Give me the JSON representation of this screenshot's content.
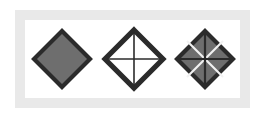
{
  "figure": {
    "page_background": "#ffffff",
    "frame": {
      "band_color": "#e9e9e9",
      "inner_panel_color": "#ffffff",
      "band_label": "outer-frame-band",
      "panel_label": "inner-white-panel"
    },
    "palette": {
      "fill_gray": "#6e6e6e",
      "stroke_dark": "#2b2b2b",
      "stroke_light": "#f2f2f2",
      "fill_white": "#ffffff"
    },
    "shapes": [
      {
        "index": 1,
        "name": "solid-gray-diamond",
        "label": "Solid filled diamond",
        "fill": "#6e6e6e",
        "stroke": "#2b2b2b",
        "stroke_width": 3,
        "size_px": 57,
        "center": {
          "x": 62,
          "y": 60
        },
        "divisions": 1,
        "cross_lines": false,
        "diagonal_lines": false
      },
      {
        "index": 2,
        "name": "outline-diamond-with-cross",
        "label": "Hollow diamond with cross",
        "fill": "#ffffff",
        "stroke": "#2b2b2b",
        "stroke_width": 4,
        "size_px": 58,
        "center": {
          "x": 134,
          "y": 60
        },
        "divisions": 4,
        "cross_lines": true,
        "diagonal_lines": false
      },
      {
        "index": 3,
        "name": "gray-diamond-eight-wedges",
        "label": "Filled diamond divided into eight wedges",
        "fill": "#6e6e6e",
        "stroke": "#2b2b2b",
        "stroke_width": 3,
        "size_px": 56,
        "center": {
          "x": 205,
          "y": 60
        },
        "divisions": 8,
        "cross_lines": true,
        "diagonal_lines": true,
        "diagonal_color": "#f2f2f2",
        "cross_color": "#2b2b2b"
      }
    ]
  }
}
